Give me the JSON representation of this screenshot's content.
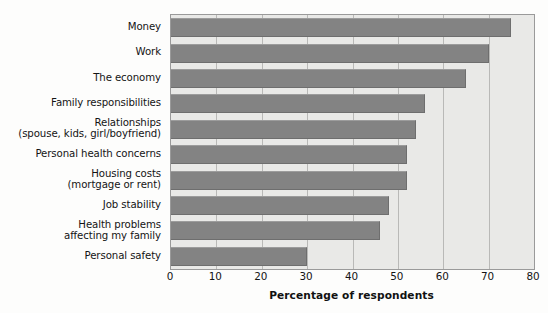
{
  "chart_data": {
    "type": "bar",
    "orientation": "horizontal",
    "title": "",
    "xlabel": "Percentage of respondents",
    "ylabel": "",
    "xlim": [
      0,
      80
    ],
    "xticks": [
      0,
      10,
      20,
      30,
      40,
      50,
      60,
      70,
      80
    ],
    "xtick_labels": [
      "0",
      "10",
      "20",
      "30",
      "40",
      "50",
      "60",
      "70",
      "80"
    ],
    "grid": "vertical",
    "legend": "none",
    "bar_color": "#838383",
    "plot_background": "#e9e9e7",
    "gridline_color": "#b9b9b7",
    "axis_border_color": "#9a9a9a",
    "categories": [
      "Money",
      "Work",
      "The economy",
      "Family responsibilities",
      "Relationships\n(spouse, kids, girl/boyfriend)",
      "Personal health concerns",
      "Housing costs\n(mortgage or rent)",
      "Job stability",
      "Health problems\naffecting my family",
      "Personal safety"
    ],
    "values": [
      75,
      70,
      65,
      56,
      54,
      52,
      52,
      48,
      46,
      30
    ]
  },
  "categories_lines": [
    [
      "Money"
    ],
    [
      "Work"
    ],
    [
      "The economy"
    ],
    [
      "Family responsibilities"
    ],
    [
      "Relationships",
      "(spouse, kids, girl/boyfriend)"
    ],
    [
      "Personal health concerns"
    ],
    [
      "Housing costs",
      "(mortgage or rent)"
    ],
    [
      "Job stability"
    ],
    [
      "Health problems",
      "affecting my family"
    ],
    [
      "Personal safety"
    ]
  ],
  "axis": {
    "title": "Percentage of respondents",
    "tick_labels": [
      "0",
      "10",
      "20",
      "30",
      "40",
      "50",
      "60",
      "70",
      "80"
    ]
  }
}
